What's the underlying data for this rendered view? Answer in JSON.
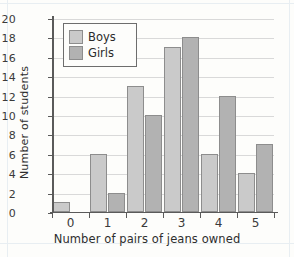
{
  "chart_data": {
    "type": "bar",
    "title": "",
    "xlabel": "Number of pairs of jeans owned",
    "ylabel": "Number of students",
    "categories": [
      "0",
      "1",
      "2",
      "3",
      "4",
      "5"
    ],
    "series": [
      {
        "name": "Boys",
        "values": [
          1,
          6,
          13,
          17,
          6,
          4
        ],
        "color": "#cacaca"
      },
      {
        "name": "Girls",
        "values": [
          0,
          2,
          10,
          18,
          12,
          7
        ],
        "color": "#b2b2b2"
      }
    ],
    "ylim": [
      0,
      20
    ],
    "ytick_values": [
      0,
      2,
      4,
      6,
      8,
      10,
      12,
      14,
      16,
      18,
      20
    ],
    "ytick_labels": [
      "0",
      "2",
      "4",
      "6",
      "8",
      "10",
      "12",
      "14",
      "16",
      "18",
      "20"
    ],
    "grid": true,
    "legend_position": "top-left",
    "legend_entries": [
      "Boys",
      "Girls"
    ]
  },
  "legend": {
    "boys_label": "Boys",
    "girls_label": "Girls"
  },
  "axes": {
    "x_title": "Number of pairs of jeans owned",
    "y_title": "Number of students"
  }
}
